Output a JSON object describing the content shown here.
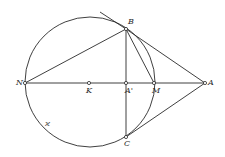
{
  "figure": {
    "type": "geometric-construction",
    "stroke_color": "#2a2a2a",
    "background": "#ffffff",
    "circle": {
      "name": "circle-kappa",
      "label": "ϰ",
      "center": "K",
      "cx": 90,
      "cy": 82,
      "r": 65
    },
    "points": {
      "N": {
        "label": "N",
        "x": 25,
        "y": 83
      },
      "K": {
        "label": "K",
        "x": 89,
        "y": 83
      },
      "A1": {
        "label": "A'",
        "x": 126,
        "y": 83
      },
      "M": {
        "label": "M",
        "x": 154,
        "y": 83
      },
      "A": {
        "label": "A",
        "x": 205,
        "y": 83
      },
      "B": {
        "label": "B",
        "x": 126,
        "y": 29
      },
      "C": {
        "label": "C",
        "x": 126,
        "y": 137
      }
    },
    "segments": [
      [
        "N",
        "A"
      ],
      [
        "N",
        "B"
      ],
      [
        "B",
        "C"
      ],
      [
        "B",
        "M"
      ],
      [
        "B",
        "A"
      ],
      [
        "C",
        "A"
      ]
    ],
    "tangent_extension": {
      "from": "B",
      "to_x": 100,
      "to_y": 12
    }
  }
}
